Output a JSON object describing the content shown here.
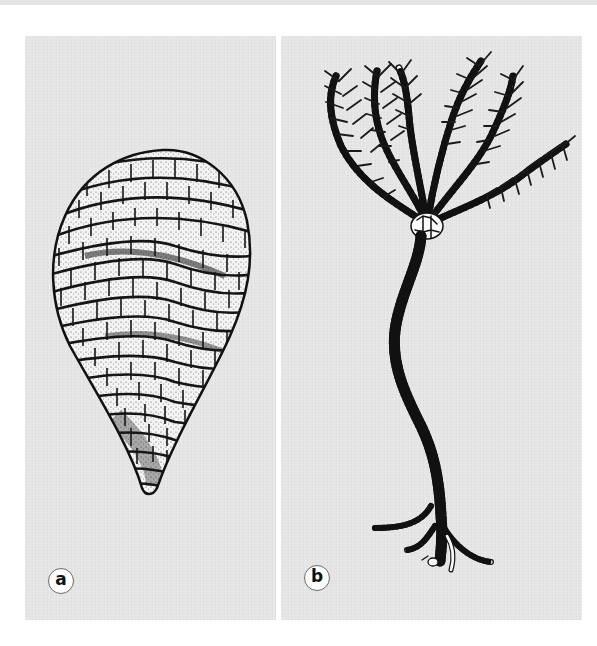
{
  "figure": {
    "panels": [
      {
        "id": "a",
        "label": "a",
        "subject": "teardrop-shaped fossil with spiral rows of rectangular plates (receptaculitid)"
      },
      {
        "id": "b",
        "label": "b",
        "subject": "crinoid (sea lily) with feathery branching arms, long segmented stem and root holdfast"
      }
    ],
    "colors": {
      "panel_background": "#e5e5e5",
      "page_background": "#ffffff",
      "ink": "#111111",
      "badge_border": "#6a6a6a"
    }
  }
}
